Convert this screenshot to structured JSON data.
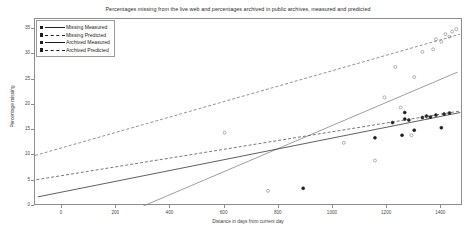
{
  "chart_data": {
    "type": "scatter",
    "title": "Percentages missing from the live web and percentages archived in public archives, measured and predicted",
    "xlabel": "Distance in days from current day",
    "ylabel": "Percentage missing",
    "xlim": [
      -100,
      1480
    ],
    "ylim": [
      0,
      37
    ],
    "xticks": [
      0,
      200,
      400,
      600,
      800,
      1000,
      1200,
      1400
    ],
    "xticklabels": [
      "0",
      "200",
      "400",
      "600",
      "800",
      "1000",
      "1200",
      "1400"
    ],
    "yticks": [
      0,
      5,
      10,
      15,
      20,
      25,
      30,
      35
    ],
    "yticklabels": [
      "0",
      "5",
      "10",
      "15",
      "20",
      "25",
      "30",
      "35"
    ],
    "grid": false,
    "legend_position": "upper-left",
    "series": [
      {
        "name": "Missing Measured",
        "style": "solid",
        "marker": "square",
        "color": "#7d7d7d",
        "kind": "scatter+line",
        "line": {
          "x0": 300,
          "y0": 0.0,
          "x1": 1460,
          "y1": 26.5
        },
        "points": [
          [
            760,
            3.0
          ],
          [
            1040,
            12.5
          ],
          [
            1190,
            21.5
          ],
          [
            1230,
            27.5
          ],
          [
            1250,
            19.5
          ],
          [
            1300,
            25.5
          ],
          [
            1330,
            30.5
          ],
          [
            1350,
            17.5
          ],
          [
            1370,
            31.0
          ],
          [
            1380,
            33.0
          ],
          [
            1400,
            32.5
          ],
          [
            1415,
            34.0
          ],
          [
            1430,
            33.5
          ],
          [
            1440,
            34.5
          ],
          [
            1455,
            35.0
          ],
          [
            1290,
            14.0
          ],
          [
            1155,
            9.0
          ],
          [
            600,
            14.5
          ]
        ]
      },
      {
        "name": "Missing Predicted",
        "style": "dashed",
        "marker": "square",
        "color": "#6e6e6e",
        "kind": "line",
        "line": {
          "x0": -100,
          "y0": 10.0,
          "x1": 1470,
          "y1": 34.0
        }
      },
      {
        "name": "Archived Measured",
        "style": "solid",
        "marker": "square",
        "color": "#2a2a2a",
        "kind": "scatter+line",
        "line": {
          "x0": -90,
          "y0": 1.8,
          "x1": 1470,
          "y1": 18.5
        },
        "points": [
          [
            890,
            3.5
          ],
          [
            1155,
            13.5
          ],
          [
            1220,
            16.5
          ],
          [
            1255,
            14.0
          ],
          [
            1265,
            17.2
          ],
          [
            1280,
            17.0
          ],
          [
            1300,
            15.0
          ],
          [
            1330,
            17.5
          ],
          [
            1345,
            17.8
          ],
          [
            1360,
            17.6
          ],
          [
            1380,
            18.0
          ],
          [
            1400,
            15.5
          ],
          [
            1410,
            18.2
          ],
          [
            1430,
            18.4
          ],
          [
            1265,
            18.5
          ]
        ]
      },
      {
        "name": "Archived Predicted",
        "style": "dashed",
        "marker": "square",
        "color": "#4a4a4a",
        "kind": "line",
        "line": {
          "x0": -95,
          "y0": 5.2,
          "x1": 1470,
          "y1": 18.8
        }
      }
    ]
  },
  "legend": {
    "items": [
      {
        "label": "Missing Measured"
      },
      {
        "label": "Missing Predicted"
      },
      {
        "label": "Archived Measured"
      },
      {
        "label": "Archived Predicted"
      }
    ]
  }
}
